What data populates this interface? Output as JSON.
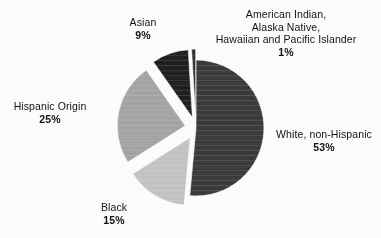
{
  "chart_data": {
    "type": "pie",
    "title": "",
    "subtitle": "",
    "xlabel": "",
    "ylabel": "",
    "legend_position": "none",
    "grid": false,
    "start_angle_deg": 0,
    "direction": "clockwise",
    "categories": [
      "White, non-Hispanic",
      "Hispanic Origin",
      "Black",
      "Asian",
      "American Indian, Alaska Native, Hawaiian and Pacific Islander"
    ],
    "values": [
      53,
      25,
      15,
      9,
      1
    ],
    "value_labels": [
      "53%",
      "25%",
      "15%",
      "9%",
      "1%"
    ],
    "units": "percent",
    "slices": [
      {
        "name": "White, non-Hispanic",
        "value": 53,
        "value_label": "53%",
        "color": "#3a3a3a",
        "exploded": false,
        "label_lines": [
          "White, non-Hispanic"
        ]
      },
      {
        "name": "American Indian, Alaska Native, Hawaiian and Pacific Islander",
        "value": 1,
        "value_label": "1%",
        "color": "#2e2e2e",
        "exploded": true,
        "label_lines": [
          "American Indian,",
          "Alaska Native,",
          "Hawaiian and Pacific Islander"
        ]
      },
      {
        "name": "Asian",
        "value": 9,
        "value_label": "9%",
        "color": "#1f1f1f",
        "exploded": true,
        "label_lines": [
          "Asian"
        ]
      },
      {
        "name": "Hispanic Origin",
        "value": 25,
        "value_label": "25%",
        "color": "#a3a3a3",
        "exploded": true,
        "label_lines": [
          "Hispanic Origin"
        ]
      },
      {
        "name": "Black",
        "value": 15,
        "value_label": "15%",
        "color": "#c2c2c2",
        "exploded": true,
        "label_lines": [
          "Black"
        ]
      }
    ]
  },
  "labels": {
    "aian": {
      "line1": "American Indian,",
      "line2": "Alaska Native,",
      "line3": "Hawaiian and Pacific Islander",
      "pct": "1%"
    },
    "white": {
      "name": "White, non-Hispanic",
      "pct": "53%"
    },
    "hispanic": {
      "name": "Hispanic Origin",
      "pct": "25%"
    },
    "black": {
      "name": "Black",
      "pct": "15%"
    },
    "asian": {
      "name": "Asian",
      "pct": "9%"
    }
  },
  "colors": {
    "background": "#fbfbfb",
    "text": "#131313",
    "white_slice": "#3a3a3a",
    "hispanic_slice": "#a3a3a3",
    "black_slice": "#c2c2c2",
    "asian_slice": "#1f1f1f",
    "aian_slice": "#2e2e2e"
  }
}
